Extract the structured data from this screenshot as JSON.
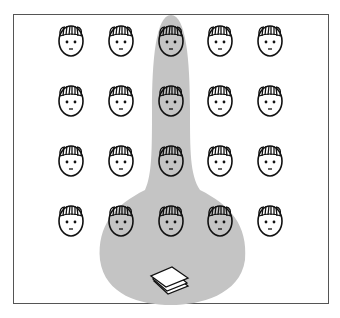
{
  "diagram": {
    "grid": {
      "columns": 5,
      "rows": 4,
      "col_x": [
        71,
        121,
        171,
        220,
        270
      ],
      "row_y": [
        41,
        101,
        161,
        221
      ]
    },
    "highlight_color": "#c4c4c4",
    "highlighted_faces": [
      [
        2,
        0
      ],
      [
        2,
        1
      ],
      [
        2,
        2
      ],
      [
        1,
        3
      ],
      [
        2,
        3
      ],
      [
        3,
        3
      ]
    ],
    "icon": "paper-stack-icon"
  }
}
